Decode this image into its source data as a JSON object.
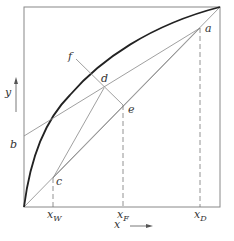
{
  "diagram": {
    "type": "McCabe-Thiele x-y diagram",
    "axes": {
      "x_label": "x",
      "y_label": "y"
    },
    "points": {
      "a": "a",
      "b": "b",
      "c": "c",
      "d": "d",
      "e": "e",
      "f": "f"
    },
    "ticks": {
      "xW": {
        "main": "x",
        "sub": "W"
      },
      "xF": {
        "main": "x",
        "sub": "F"
      },
      "xD": {
        "main": "x",
        "sub": "D"
      }
    },
    "colors": {
      "line": "#777777",
      "curve": "#222222",
      "text": "#333333"
    }
  }
}
